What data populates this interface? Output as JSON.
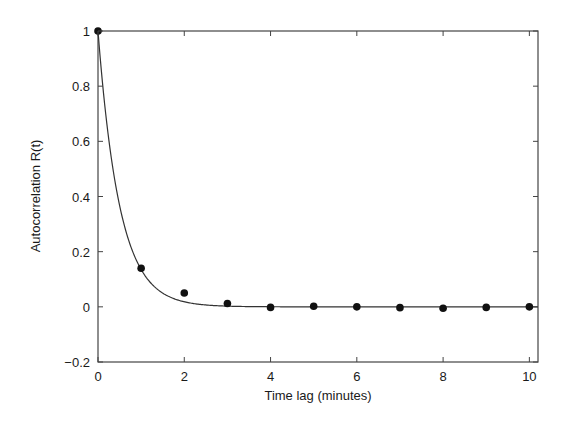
{
  "chart_data": {
    "type": "scatter",
    "title": "",
    "xlabel": "Time lag (minutes)",
    "ylabel": "Autocorrelation R(t)",
    "xlim": [
      0,
      10.2
    ],
    "ylim": [
      -0.2,
      1
    ],
    "xticks": [
      0,
      2,
      4,
      6,
      8,
      10
    ],
    "xtick_labels": [
      "0",
      "2",
      "4",
      "6",
      "8",
      "10"
    ],
    "yticks": [
      -0.2,
      0,
      0.2,
      0.4,
      0.6,
      0.8,
      1
    ],
    "ytick_labels": [
      "−0.2",
      "0",
      "0.2",
      "0.4",
      "0.6",
      "0.8",
      "1"
    ],
    "grid": false,
    "legend": null,
    "series": [
      {
        "name": "Observed autocorrelation",
        "kind": "scatter",
        "x": [
          0,
          1,
          2,
          3,
          4,
          5,
          6,
          7,
          8,
          9,
          10
        ],
        "y": [
          1.0,
          0.14,
          0.05,
          0.012,
          -0.002,
          0.002,
          0.0,
          -0.003,
          -0.005,
          -0.002,
          0.0
        ]
      },
      {
        "name": "Exponential fit",
        "kind": "line",
        "formula": "R(t) = exp(-t / 0.5)",
        "tau": 0.5
      }
    ],
    "colors": {
      "points": "#111111",
      "line": "#333333",
      "axes": "#444444"
    }
  }
}
